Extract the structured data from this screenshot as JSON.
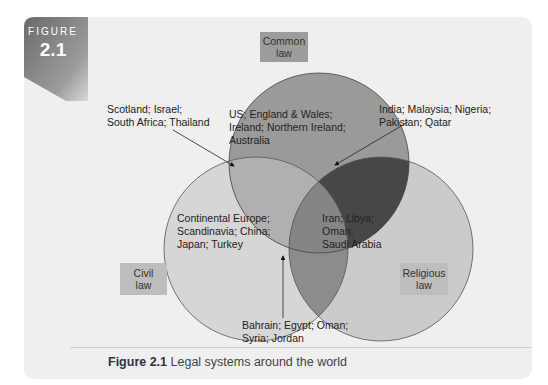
{
  "figure": {
    "badge_label": "FIGURE",
    "badge_number": "2.1",
    "caption_prefix": "Figure 2.1",
    "caption_text": "Legal systems around the world"
  },
  "sets": {
    "common": {
      "label": "Common law",
      "label_line1": "Common",
      "label_line2": "law",
      "color": "#9a9a9a"
    },
    "civil": {
      "label": "Civil law",
      "label_line1": "Civil",
      "label_line2": "law",
      "color": "#d6d6d6"
    },
    "religious": {
      "label": "Religious law",
      "label_line1": "Religious",
      "label_line2": "law",
      "color": "#c8c8c8"
    }
  },
  "regions": {
    "common_only": {
      "line1": "US; England & Wales;",
      "line2": "Ireland; Northern Ireland;",
      "line3": "Australia"
    },
    "civil_only": {
      "line1": "Continental Europe;",
      "line2": "Scandinavia; China;",
      "line3": "Japan; Turkey"
    },
    "religious_only": {
      "line1": "Iran; Libya;",
      "line2": "Oman;",
      "line3": "Saudi Arabia"
    },
    "common_civil": {
      "line1": "Scotland; Israel;",
      "line2": "South Africa; Thailand"
    },
    "common_religious": {
      "line1": "India; Malaysia; Nigeria;",
      "line2": "Pakistan; Qatar"
    },
    "civil_religious": {
      "line1": "Bahrain; Egypt; Oman;",
      "line2": "Syria; Jordan"
    }
  },
  "colors": {
    "panel": "#efefef",
    "badge": "#6e6e6e",
    "common_civil_overlap": "#b0b0b0",
    "common_religious_overlap": "#4a4a4a",
    "civil_religious_overlap": "#8a8a8a",
    "center_overlap": "#858585"
  }
}
